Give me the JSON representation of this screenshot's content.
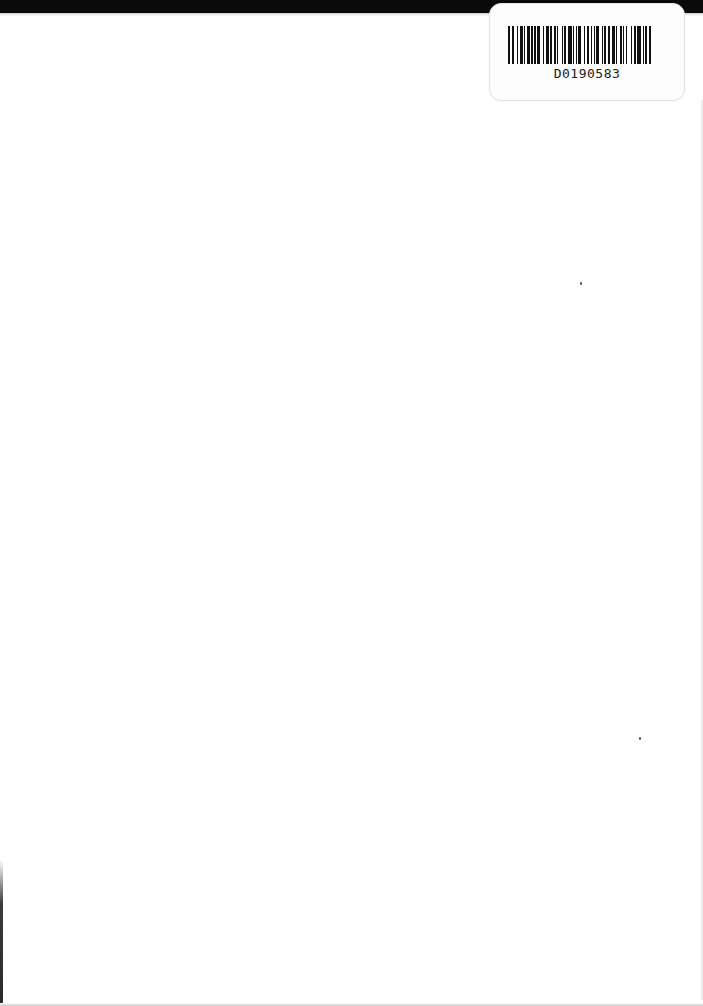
{
  "document": {
    "type": "blank scanned page",
    "background_color": "#ffffff",
    "top_band_color": "#0a0a0a"
  },
  "barcode_label": {
    "code_text": "D0190583",
    "bar_pattern": [
      2,
      2,
      1,
      3,
      1,
      2,
      2,
      1,
      1,
      2,
      3,
      1,
      1,
      1,
      2,
      1,
      3,
      2,
      1,
      2,
      3,
      1,
      1,
      2,
      2,
      1,
      1,
      3,
      1,
      1,
      2,
      2,
      3,
      1,
      1,
      2,
      1,
      1,
      2,
      3,
      1,
      2,
      2,
      1,
      1,
      2,
      1,
      1,
      3,
      2,
      1,
      1,
      2,
      2,
      1,
      2,
      3,
      1,
      1,
      2,
      2,
      1,
      1,
      2,
      1,
      3,
      1,
      2,
      2,
      1,
      3,
      2,
      1,
      1,
      2,
      1,
      2,
      2
    ]
  },
  "specks": [
    {
      "x": 580,
      "y": 282
    },
    {
      "x": 639,
      "y": 737
    }
  ]
}
